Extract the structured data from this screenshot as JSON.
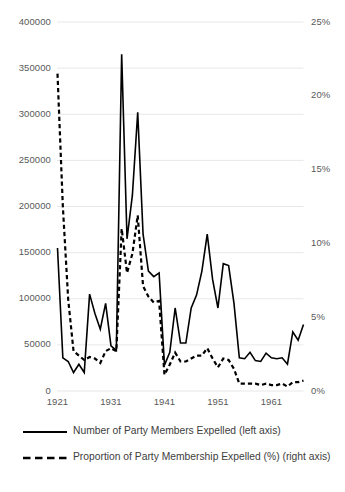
{
  "chart_data": {
    "type": "line",
    "title": "",
    "subtitle": "",
    "xlabel": "",
    "ylabel": "",
    "grid": true,
    "legend_position": "bottom-left",
    "x": [
      1921,
      1922,
      1923,
      1924,
      1925,
      1926,
      1927,
      1928,
      1929,
      1930,
      1931,
      1932,
      1933,
      1934,
      1935,
      1936,
      1937,
      1938,
      1939,
      1940,
      1941,
      1942,
      1943,
      1944,
      1945,
      1946,
      1947,
      1948,
      1949,
      1950,
      1951,
      1952,
      1953,
      1954,
      1955,
      1956,
      1957,
      1958,
      1959,
      1960,
      1961,
      1962,
      1963,
      1964,
      1965,
      1966,
      1967
    ],
    "x_ticks": [
      "1921",
      "1931",
      "1941",
      "1951",
      "1961"
    ],
    "x_tick_values": [
      1921,
      1931,
      1941,
      1951,
      1961
    ],
    "axes": [
      {
        "id": "left",
        "side": "left",
        "label": "Number of Party Members Expelled",
        "ylim": [
          0,
          400000
        ],
        "ticks": [
          0,
          50000,
          100000,
          150000,
          200000,
          250000,
          300000,
          350000,
          400000
        ],
        "tick_labels": [
          "0",
          "50000",
          "100000",
          "150000",
          "200000",
          "250000",
          "300000",
          "350000",
          "400000"
        ]
      },
      {
        "id": "right",
        "side": "right",
        "label": "Proportion of Party Membership Expelled (%)",
        "ylim": [
          0,
          25
        ],
        "ticks": [
          0,
          5,
          10,
          15,
          20,
          25
        ],
        "tick_labels": [
          "0%",
          "5%",
          "10%",
          "15%",
          "20%",
          "25%"
        ]
      }
    ],
    "series": [
      {
        "name": "Number of Party Members Expelled (left axis)",
        "axis": "left",
        "style": "solid",
        "color": "#000000",
        "width": 1.6,
        "values": [
          155000,
          36000,
          32000,
          20000,
          29000,
          20000,
          105000,
          84000,
          67000,
          95000,
          49000,
          44000,
          365000,
          165000,
          212000,
          302000,
          170000,
          130000,
          124000,
          128000,
          28000,
          42000,
          90000,
          52000,
          52000,
          90000,
          104000,
          130000,
          170000,
          121000,
          90000,
          138000,
          136000,
          95000,
          36000,
          35000,
          42000,
          33000,
          32000,
          41000,
          36000,
          35000,
          36000,
          29000,
          64000,
          55000,
          72000
        ]
      },
      {
        "name": "Proportion of Party Membership Expelled (%) (right axis)",
        "axis": "right",
        "style": "dashed",
        "color": "#000000",
        "width": 2.2,
        "values": [
          21.5,
          12.5,
          6.2,
          2.7,
          2.4,
          2.1,
          2.3,
          2.2,
          1.9,
          2.7,
          2.9,
          2.7,
          11.0,
          8.0,
          9.3,
          11.9,
          7.1,
          6.4,
          6.0,
          6.1,
          1.1,
          1.8,
          2.6,
          2.0,
          2.0,
          2.2,
          2.4,
          2.4,
          2.9,
          2.2,
          1.6,
          2.2,
          2.1,
          1.5,
          0.5,
          0.5,
          0.5,
          0.5,
          0.4,
          0.5,
          0.4,
          0.4,
          0.5,
          0.3,
          0.6,
          0.6,
          0.7
        ]
      }
    ]
  },
  "legend": {
    "items": [
      {
        "label": "Number of Party Members Expelled (left axis)",
        "style": "solid"
      },
      {
        "label": "Proportion of Party Membership Expelled (%) (right axis)",
        "style": "dashed"
      }
    ]
  },
  "colors": {
    "series": "#000000",
    "gridline": "#e8e8e8",
    "tick_text": "#595959",
    "legend_text": "#404040",
    "background": "#ffffff"
  }
}
